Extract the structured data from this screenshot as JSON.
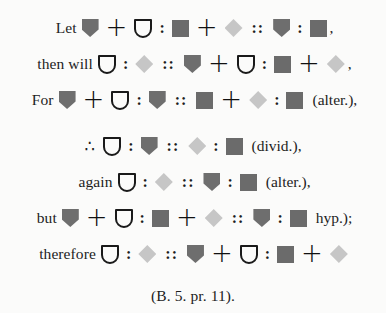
{
  "symbols": {
    "shield": {
      "name": "shield-icon",
      "color": "#6e6e6e"
    },
    "square": {
      "name": "square-icon",
      "color": "#6b6b6b"
    },
    "diamond": {
      "name": "diamond-icon",
      "color": "#c6c6c6"
    },
    "cup": {
      "name": "cup-outline-icon",
      "color": "#1a1a1a"
    }
  },
  "lines": [
    {
      "top": 16,
      "tokens": [
        {
          "t": "word",
          "v": "Let"
        },
        {
          "t": "shape",
          "v": "shield"
        },
        {
          "t": "plus",
          "v": "+"
        },
        {
          "t": "shape",
          "v": "cup"
        },
        {
          "t": "colon",
          "v": ":"
        },
        {
          "t": "shape",
          "v": "square"
        },
        {
          "t": "plus",
          "v": "+"
        },
        {
          "t": "shape",
          "v": "diamond"
        },
        {
          "t": "dcolon",
          "v": "::"
        },
        {
          "t": "shape",
          "v": "shield"
        },
        {
          "t": "colon",
          "v": ":"
        },
        {
          "t": "shape",
          "v": "square"
        },
        {
          "t": "punct",
          "v": ","
        }
      ]
    },
    {
      "top": 52,
      "tokens": [
        {
          "t": "word",
          "v": "then will"
        },
        {
          "t": "shape",
          "v": "cup"
        },
        {
          "t": "colon",
          "v": ":"
        },
        {
          "t": "shape",
          "v": "diamond"
        },
        {
          "t": "dcolon",
          "v": "::"
        },
        {
          "t": "shape",
          "v": "shield"
        },
        {
          "t": "plus",
          "v": "+"
        },
        {
          "t": "shape",
          "v": "cup"
        },
        {
          "t": "colon",
          "v": ":"
        },
        {
          "t": "shape",
          "v": "square"
        },
        {
          "t": "plus",
          "v": "+"
        },
        {
          "t": "shape",
          "v": "diamond"
        },
        {
          "t": "punct",
          "v": ","
        }
      ]
    },
    {
      "top": 88,
      "tokens": [
        {
          "t": "word",
          "v": "For"
        },
        {
          "t": "shape",
          "v": "shield"
        },
        {
          "t": "plus",
          "v": "+"
        },
        {
          "t": "shape",
          "v": "cup"
        },
        {
          "t": "colon",
          "v": ":"
        },
        {
          "t": "shape",
          "v": "shield"
        },
        {
          "t": "dcolon",
          "v": "::"
        },
        {
          "t": "shape",
          "v": "square"
        },
        {
          "t": "plus",
          "v": "+"
        },
        {
          "t": "shape",
          "v": "diamond"
        },
        {
          "t": "colon",
          "v": ":"
        },
        {
          "t": "shape",
          "v": "square"
        },
        {
          "t": "note",
          "v": "(alter.),"
        }
      ]
    },
    {
      "top": 134,
      "tokens": [
        {
          "t": "therefore",
          "v": "∴"
        },
        {
          "t": "shape",
          "v": "cup"
        },
        {
          "t": "colon",
          "v": ":"
        },
        {
          "t": "shape",
          "v": "shield"
        },
        {
          "t": "dcolon",
          "v": "::"
        },
        {
          "t": "shape",
          "v": "diamond"
        },
        {
          "t": "colon",
          "v": ":"
        },
        {
          "t": "shape",
          "v": "square"
        },
        {
          "t": "note",
          "v": "(divid.),"
        }
      ]
    },
    {
      "top": 170,
      "tokens": [
        {
          "t": "word",
          "v": "again"
        },
        {
          "t": "shape",
          "v": "cup"
        },
        {
          "t": "colon",
          "v": ":"
        },
        {
          "t": "shape",
          "v": "diamond"
        },
        {
          "t": "dcolon",
          "v": "::"
        },
        {
          "t": "shape",
          "v": "shield"
        },
        {
          "t": "colon",
          "v": ":"
        },
        {
          "t": "shape",
          "v": "square"
        },
        {
          "t": "note",
          "v": "(alter.),"
        }
      ]
    },
    {
      "top": 206,
      "tokens": [
        {
          "t": "word",
          "v": "but"
        },
        {
          "t": "shape",
          "v": "shield"
        },
        {
          "t": "plus",
          "v": "+"
        },
        {
          "t": "shape",
          "v": "cup"
        },
        {
          "t": "colon",
          "v": ":"
        },
        {
          "t": "shape",
          "v": "square"
        },
        {
          "t": "plus",
          "v": "+"
        },
        {
          "t": "shape",
          "v": "diamond"
        },
        {
          "t": "dcolon",
          "v": "::"
        },
        {
          "t": "shape",
          "v": "shield"
        },
        {
          "t": "colon",
          "v": ":"
        },
        {
          "t": "shape",
          "v": "square"
        },
        {
          "t": "note",
          "v": "hyp.);"
        }
      ]
    },
    {
      "top": 242,
      "tokens": [
        {
          "t": "word",
          "v": "therefore"
        },
        {
          "t": "shape",
          "v": "cup"
        },
        {
          "t": "colon",
          "v": ":"
        },
        {
          "t": "shape",
          "v": "diamond"
        },
        {
          "t": "dcolon",
          "v": "::"
        },
        {
          "t": "shape",
          "v": "shield"
        },
        {
          "t": "plus",
          "v": "+"
        },
        {
          "t": "shape",
          "v": "cup"
        },
        {
          "t": "colon",
          "v": ":"
        },
        {
          "t": "shape",
          "v": "square"
        },
        {
          "t": "plus",
          "v": "+"
        },
        {
          "t": "shape",
          "v": "diamond"
        }
      ]
    },
    {
      "top": 284,
      "tokens": [
        {
          "t": "word",
          "v": "(B. 5. pr. 11)."
        }
      ]
    }
  ]
}
